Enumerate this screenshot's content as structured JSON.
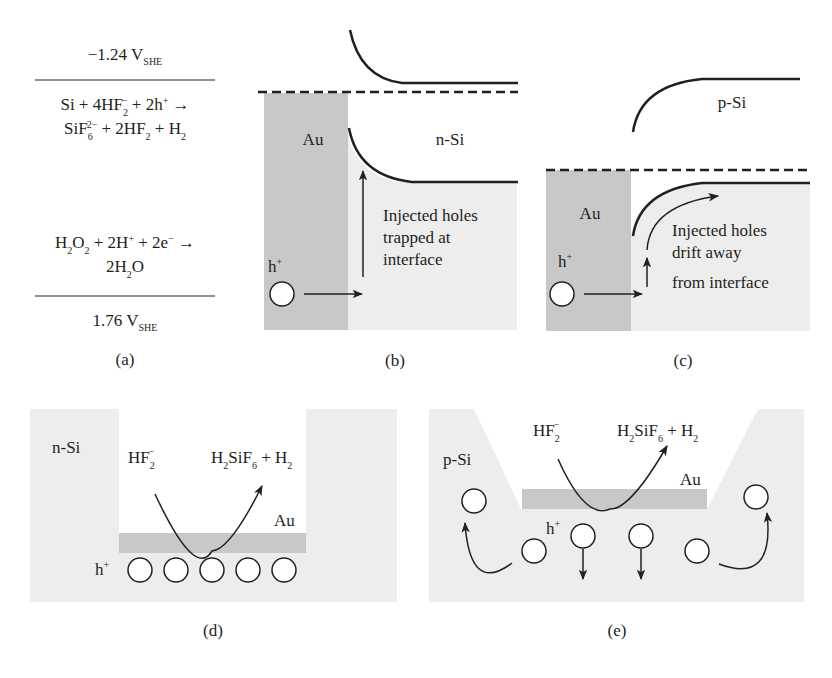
{
  "colors": {
    "au": "#c8c8c8",
    "si": "#ededed",
    "ink": "#231f20",
    "bg": "#ffffff"
  },
  "panel_a": {
    "top_potential": "−1.24 V",
    "top_potential_sub": "SHE",
    "anode_line1": [
      "Si + 4HF",
      "2",
      "−",
      " + 2h",
      "+",
      " →"
    ],
    "anode_line2": [
      "SiF",
      "6",
      "2−",
      " + 2HF",
      "2",
      " + H",
      "2"
    ],
    "cathode_line1": [
      "H",
      "2",
      "O",
      "2",
      " + 2H",
      "+",
      " + 2e",
      "−",
      " →"
    ],
    "cathode_line2": [
      "2H",
      "2",
      "O"
    ],
    "bottom_potential": "1.76 V",
    "bottom_potential_sub": "SHE",
    "caption": "(a)"
  },
  "panel_b": {
    "metal": "Au",
    "semiconductor": "n-Si",
    "carrier": "h",
    "carrier_sup": "+",
    "note": [
      "Injected holes",
      "trapped at",
      "interface"
    ],
    "caption": "(b)"
  },
  "panel_c": {
    "metal": "Au",
    "semiconductor": "p-Si",
    "carrier": "h",
    "carrier_sup": "+",
    "note": [
      "Injected holes",
      "drift away",
      "from interface"
    ],
    "caption": "(c)"
  },
  "panel_d": {
    "semiconductor": "n-Si",
    "reactant": "HF",
    "reactant_sub": "2",
    "reactant_sup": "−",
    "product": [
      "H",
      "2",
      "SiF",
      "6",
      " + H",
      "2"
    ],
    "metal": "Au",
    "carrier": "h",
    "carrier_sup": "+",
    "caption": "(d)"
  },
  "panel_e": {
    "semiconductor": "p-Si",
    "reactant": "HF",
    "reactant_sub": "2",
    "reactant_sup": "−",
    "product": [
      "H",
      "2",
      "SiF",
      "6",
      " + H",
      "2"
    ],
    "metal": "Au",
    "carrier": "h",
    "carrier_sup": "+",
    "caption": "(e)"
  }
}
